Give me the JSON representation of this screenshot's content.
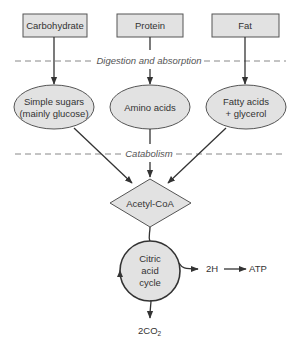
{
  "diagram": {
    "sources": [
      {
        "label": "Carbohydrate"
      },
      {
        "label": "Protein"
      },
      {
        "label": "Fat"
      }
    ],
    "stages": {
      "digestion": "Digestion and absorption",
      "catabolism": "Catabolism"
    },
    "products": [
      {
        "line1": "Simple sugars",
        "line2": "(mainly glucose)"
      },
      {
        "line1": "Amino acids",
        "line2": ""
      },
      {
        "line1": "Fatty acids",
        "line2": "+ glycerol"
      }
    ],
    "hub": {
      "label": "Acetyl-CoA"
    },
    "cycle": {
      "line1": "Citric",
      "line2": "acid",
      "line3": "cycle"
    },
    "outputs": {
      "hydrogen": "2H",
      "atp": "ATP",
      "co2_main": "2CO",
      "co2_sub": "2"
    },
    "colors": {
      "node_fill": "#e2e2e2",
      "node_stroke": "#555555",
      "arrow": "#333333",
      "dash": "#888888"
    }
  }
}
